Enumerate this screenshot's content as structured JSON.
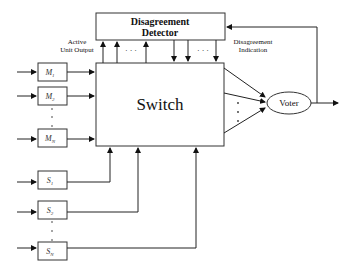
{
  "detector": {
    "line1": "Disagreement",
    "line2": "Detector"
  },
  "switch": {
    "label": "Switch"
  },
  "voter": {
    "label": "Voter"
  },
  "annotations": {
    "active_output_1": "Active",
    "active_output_2": "Unit Output",
    "disagreement_1": "Disagreement",
    "disagreement_2": "Indication"
  },
  "modules": [
    {
      "base": "M",
      "sub": "1"
    },
    {
      "base": "M",
      "sub": "2"
    },
    {
      "base": "M",
      "sub": "N"
    }
  ],
  "spares": [
    {
      "base": "S",
      "sub": "1"
    },
    {
      "base": "S",
      "sub": "2"
    },
    {
      "base": "S",
      "sub": "N"
    }
  ],
  "ellipsis": "· · ·"
}
